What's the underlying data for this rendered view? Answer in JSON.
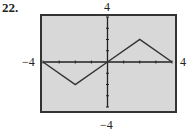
{
  "problem_number": "22.",
  "window": {
    "xmin_label": "−4",
    "xmax_label": "4",
    "ymax_label": "4",
    "ymin_label": "−4"
  },
  "colors": {
    "background": "#d8d8d8",
    "frame": "#333333",
    "curve": "#333333",
    "axes": "#222222"
  },
  "chart_data": {
    "type": "line",
    "title": "",
    "xlabel": "",
    "ylabel": "",
    "xlim": [
      -4,
      4
    ],
    "ylim": [
      -4,
      4
    ],
    "xticks": [
      -4,
      -3,
      -2,
      -1,
      0,
      1,
      2,
      3,
      4
    ],
    "yticks": [
      -4,
      -3,
      -2,
      -1,
      0,
      1,
      2,
      3,
      4
    ],
    "tick_labels": {
      "x_left": "−4",
      "x_right": "4",
      "y_top": "4",
      "y_bottom": "−4"
    },
    "grid": false,
    "legend": null,
    "series": [
      {
        "name": "f(x)",
        "x": [
          -4,
          -2,
          0,
          2,
          4
        ],
        "y": [
          0,
          -2,
          0,
          2,
          0
        ]
      }
    ]
  }
}
